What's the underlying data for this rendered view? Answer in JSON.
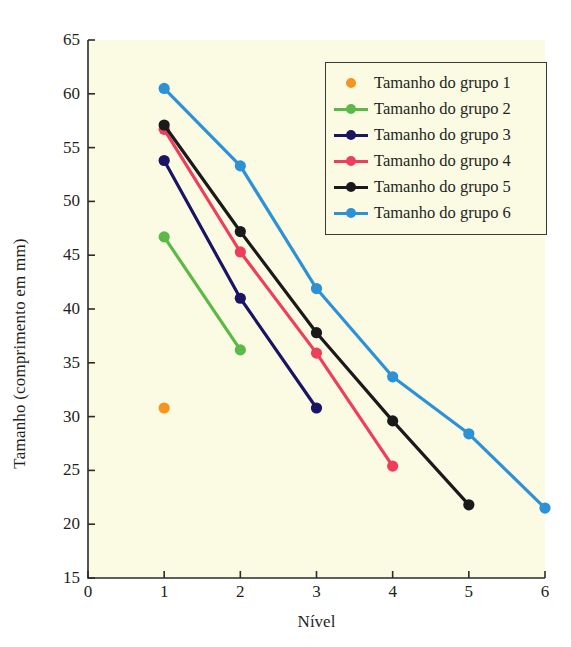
{
  "chart_data": {
    "type": "line",
    "title": "",
    "xlabel": "Nível",
    "ylabel": "Tamanho (comprimento em mm)",
    "xlim": [
      0,
      6
    ],
    "ylim": [
      15,
      65
    ],
    "xticks": [
      "0",
      "1",
      "2",
      "3",
      "4",
      "5",
      "6"
    ],
    "yticks": [
      "15",
      "20",
      "25",
      "30",
      "35",
      "40",
      "45",
      "50",
      "55",
      "60",
      "65"
    ],
    "grid": false,
    "legend_position": "top-right",
    "plot_background": "#fbfbe4",
    "figure_background": "#ffffff",
    "series": [
      {
        "name": "Tamanho do grupo 1",
        "color": "#f7941e",
        "marker_only": true,
        "x": [
          1
        ],
        "values": [
          30.8
        ]
      },
      {
        "name": "Tamanho do grupo 2",
        "color": "#5cb947",
        "marker_only": false,
        "x": [
          1,
          2
        ],
        "values": [
          46.7,
          36.2
        ]
      },
      {
        "name": "Tamanho do grupo 3",
        "color": "#1b1464",
        "marker_only": false,
        "x": [
          1,
          2,
          3
        ],
        "values": [
          53.8,
          41.0,
          30.8
        ]
      },
      {
        "name": "Tamanho do grupo 4",
        "color": "#ef3e5b",
        "marker_only": false,
        "x": [
          1,
          2,
          3,
          4
        ],
        "values": [
          56.7,
          45.3,
          35.9,
          25.4
        ]
      },
      {
        "name": "Tamanho do grupo 5",
        "color": "#1a1a1a",
        "marker_only": false,
        "x": [
          1,
          2,
          3,
          4,
          5
        ],
        "values": [
          57.1,
          47.2,
          37.8,
          29.6,
          21.8
        ]
      },
      {
        "name": "Tamanho do grupo 6",
        "color": "#2d91d6",
        "marker_only": false,
        "x": [
          1,
          2,
          3,
          4,
          5,
          6
        ],
        "values": [
          60.5,
          53.3,
          41.9,
          33.7,
          28.4,
          21.5
        ]
      }
    ]
  }
}
